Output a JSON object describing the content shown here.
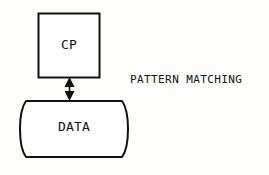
{
  "diagram": {
    "background_color": "#fdfdfb",
    "stroke_color": "#111111",
    "nodes": [
      {
        "id": "cp",
        "label": "CP",
        "shape": "rectangle",
        "x": 38,
        "y": 13,
        "width": 62,
        "height": 65
      },
      {
        "id": "data",
        "label": "DATA",
        "shape": "drum",
        "x": 17,
        "y": 100,
        "width": 114,
        "height": 58
      }
    ],
    "connectors": [
      {
        "id": "cp-data-link",
        "from": "cp",
        "to": "data",
        "style": "double-headed-arrow",
        "orientation": "vertical",
        "x": 69,
        "y_start": 78,
        "y_end": 100
      }
    ],
    "annotations": [
      {
        "id": "pattern-matching",
        "text": "PATTERN MATCHING",
        "x": 130,
        "y": 73
      }
    ]
  }
}
